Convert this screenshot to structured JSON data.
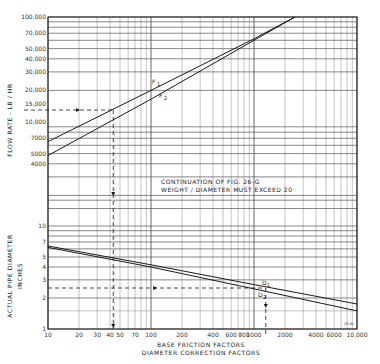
{
  "chart_data": [
    {
      "type": "line",
      "title": "Flow rate vs friction factor",
      "xlabel": "BASE FRICTION FACTORS",
      "ylabel": "FLOW RATE - LB / HR",
      "xscale": "log",
      "yscale": "log",
      "xlim": [
        10,
        10000
      ],
      "ylim": [
        2000,
        100000
      ],
      "x_ticks": [
        "10",
        "20",
        "30",
        "40",
        "50",
        "70",
        "100",
        "200",
        "400",
        "600",
        "800",
        "1000",
        "2000",
        "4000",
        "6000",
        "10,000"
      ],
      "y_ticks": [
        "100,000",
        "70,000",
        "50,000",
        "40,000",
        "30,000",
        "20,000",
        "15,000",
        "10,000",
        "7000",
        "5000",
        "4000"
      ],
      "grid": true,
      "series": [
        {
          "name": "F1",
          "x": [
            10,
            100,
            1000,
            2500
          ],
          "y": [
            6500,
            20000,
            62000,
            100000
          ]
        },
        {
          "name": "F2",
          "x": [
            10,
            100,
            1000,
            2500
          ],
          "y": [
            4800,
            16500,
            60000,
            100000
          ]
        }
      ],
      "annotations": [
        {
          "type": "dashed-arrow",
          "from": [
            10,
            13000
          ],
          "to": [
            43,
            13000
          ],
          "direction": "right"
        },
        {
          "type": "dashed-arrow",
          "from": [
            43,
            13000
          ],
          "to": [
            43,
            1
          ],
          "direction": "down"
        }
      ]
    },
    {
      "type": "line",
      "title": "Actual pipe diameter vs diameter correction factor",
      "xlabel": "DIAMETER CORRECTION FACTORS",
      "ylabel": "ACTUAL PIPE DIAMETER INCHES",
      "xscale": "log",
      "yscale": "log",
      "xlim": [
        10,
        10000
      ],
      "ylim": [
        1,
        10
      ],
      "y_ticks": [
        "10",
        "7",
        "5",
        "4",
        "3",
        "2",
        "1"
      ],
      "grid": true,
      "series": [
        {
          "name": "D1",
          "x": [
            10,
            100,
            1000,
            10000
          ],
          "y": [
            6.4,
            4.2,
            2.7,
            1.75
          ]
        },
        {
          "name": "D2",
          "x": [
            10,
            100,
            1000,
            10000
          ],
          "y": [
            6.2,
            4.0,
            2.45,
            1.5
          ]
        }
      ],
      "annotations": [
        {
          "type": "dashed-arrow",
          "from": [
            10,
            2.5
          ],
          "to": [
            1300,
            2.5
          ],
          "direction": "right"
        },
        {
          "type": "dashed-arrow",
          "from": [
            1300,
            2.5
          ],
          "to": [
            1300,
            1
          ],
          "direction": "down"
        }
      ]
    }
  ],
  "labels": {
    "flow_axis": "FLOW RATE - LB / HR",
    "dia_axis_1": "ACTUAL   PIPE   DIAMETER",
    "dia_axis_2": "INCHES",
    "x_axis_1": "BASE   FRICTION   FACTORS",
    "x_axis_2": "DIAMETER   CORRECTION   FACTORS",
    "note_1": "CONTINUATION  OF  FIG.  26-G",
    "note_2": "WEIGHT / DIAMETER  MUST  EXCEED  20",
    "f1": "F",
    "f1_sub": "1",
    "f2": "F",
    "f2_sub": "2",
    "d1": "D",
    "d1_sub": "1",
    "d2": "D",
    "d2_sub": "2",
    "fig_code": "26-H"
  },
  "ticks": {
    "x": [
      {
        "v": 10,
        "t": "10"
      },
      {
        "v": 20,
        "t": "20"
      },
      {
        "v": 30,
        "t": "30"
      },
      {
        "v": 40,
        "t": "40"
      },
      {
        "v": 50,
        "t": "50"
      },
      {
        "v": 70,
        "t": "70"
      },
      {
        "v": 100,
        "t": "100"
      },
      {
        "v": 200,
        "t": "200"
      },
      {
        "v": 400,
        "t": "400"
      },
      {
        "v": 600,
        "t": "600"
      },
      {
        "v": 800,
        "t": "800"
      },
      {
        "v": 1000,
        "t": "1000"
      },
      {
        "v": 2000,
        "t": "2000"
      },
      {
        "v": 4000,
        "t": "4000"
      },
      {
        "v": 6000,
        "t": "6000"
      },
      {
        "v": 10000,
        "t": "10,000"
      }
    ],
    "flow": [
      {
        "v": 100000,
        "t": "100,000"
      },
      {
        "v": 70000,
        "t": "70,000"
      },
      {
        "v": 50000,
        "t": "50,000"
      },
      {
        "v": 40000,
        "t": "40,000"
      },
      {
        "v": 30000,
        "t": "30,000"
      },
      {
        "v": 20000,
        "t": "20,000"
      },
      {
        "v": 15000,
        "t": "15,000"
      },
      {
        "v": 10000,
        "t": "10,000"
      },
      {
        "v": 7000,
        "t": "7000"
      },
      {
        "v": 5000,
        "t": "5000"
      },
      {
        "v": 4000,
        "t": "4000"
      }
    ],
    "dia": [
      {
        "v": 10,
        "t": "10"
      },
      {
        "v": 7,
        "t": "7"
      },
      {
        "v": 5,
        "t": "5"
      },
      {
        "v": 4,
        "t": "4"
      },
      {
        "v": 3,
        "t": "3"
      },
      {
        "v": 2,
        "t": "2"
      },
      {
        "v": 1,
        "t": "1"
      }
    ]
  },
  "colors": {
    "ink": "#1a1a1a",
    "grid": "#555555",
    "grid_light": "#9a9a9a",
    "background": "#ffffff"
  }
}
